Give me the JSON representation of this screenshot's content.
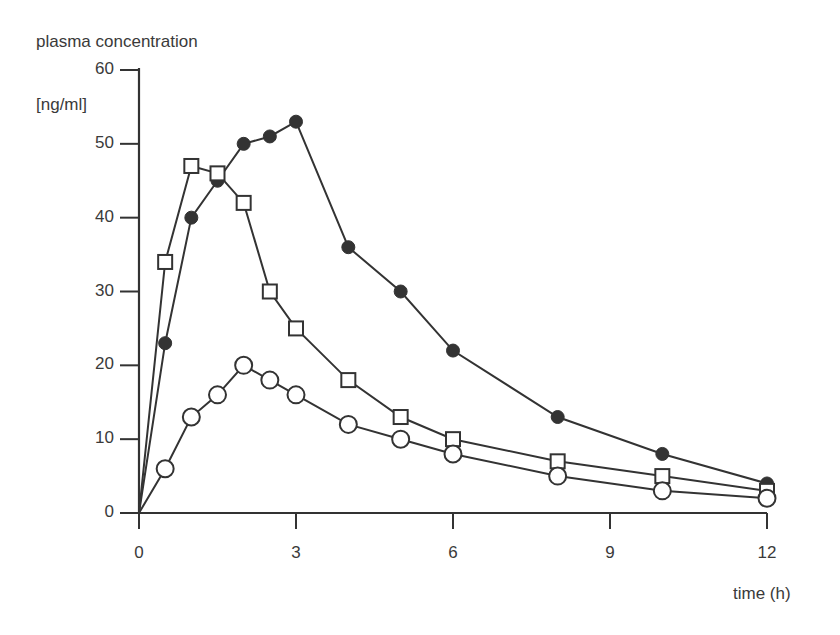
{
  "chart_data": {
    "type": "line",
    "title": "",
    "ylabel": "plasma concentration",
    "yunit": "[ng/ml]",
    "xlabel": "time (h)",
    "xlim": [
      0,
      12
    ],
    "ylim": [
      0,
      60
    ],
    "xticks": [
      0,
      3,
      6,
      9,
      12
    ],
    "yticks": [
      0,
      10,
      20,
      30,
      40,
      50,
      60
    ],
    "grid": false,
    "legend": null,
    "series": [
      {
        "name": "filled-circle",
        "marker": "filled-circle",
        "x": [
          0,
          0.5,
          1,
          1.5,
          2,
          2.5,
          3,
          4,
          5,
          6,
          8,
          10,
          12
        ],
        "values": [
          0,
          23,
          40,
          45,
          50,
          51,
          53,
          36,
          30,
          22,
          13,
          8,
          4
        ]
      },
      {
        "name": "open-square",
        "marker": "open-square",
        "x": [
          0,
          0.5,
          1,
          1.5,
          2,
          2.5,
          3,
          4,
          5,
          6,
          8,
          10,
          12
        ],
        "values": [
          0,
          34,
          47,
          46,
          42,
          30,
          25,
          18,
          13,
          10,
          7,
          5,
          3
        ]
      },
      {
        "name": "open-circle",
        "marker": "open-circle",
        "x": [
          0,
          0.5,
          1,
          1.5,
          2,
          2.5,
          3,
          4,
          5,
          6,
          8,
          10,
          12
        ],
        "values": [
          0,
          6,
          13,
          16,
          20,
          18,
          16,
          12,
          10,
          8,
          5,
          3,
          2
        ]
      }
    ]
  },
  "labels": {
    "ylabel": "plasma concentration",
    "yunit": "[ng/ml]",
    "xlabel": "time (h)",
    "yticks": [
      "0",
      "10",
      "20",
      "30",
      "40",
      "50",
      "60"
    ],
    "xticks": [
      "0",
      "3",
      "6",
      "9",
      "12"
    ]
  },
  "colors": {
    "ink": "#333333",
    "background": "#ffffff"
  }
}
